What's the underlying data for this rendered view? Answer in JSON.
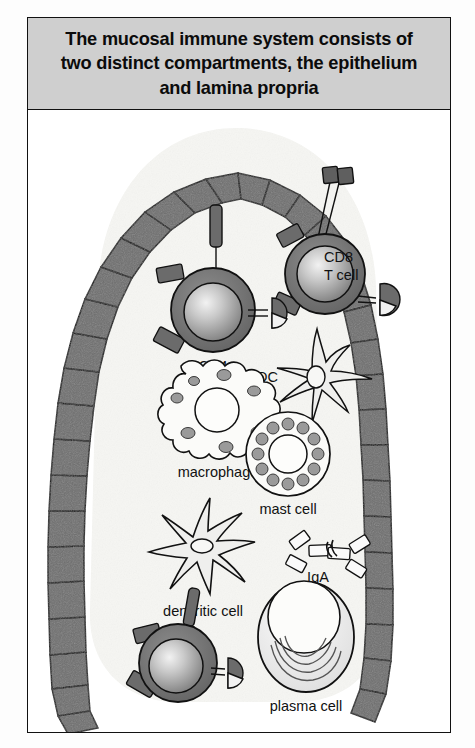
{
  "figure": {
    "title": "The mucosal immune system consists of\ntwo distinct compartments, the epithelium\nand lamina propria",
    "title_bg": "#cfcfcf",
    "border_color": "#111111",
    "background": "#ffffff"
  },
  "diagram": {
    "type": "biological-schematic",
    "compartments": [
      {
        "id": "epithelium",
        "color": "#6e6e6e",
        "description": "arch of columnar epithelial cells"
      },
      {
        "id": "lamina-propria",
        "color": "#f7f7f5",
        "description": "interior space beneath epithelium"
      }
    ],
    "cells": [
      {
        "id": "cd8-t-cell",
        "label": "CD8\nT cell",
        "label_line1": "CD8",
        "label_line2": "T cell",
        "location": "intraepithelial",
        "features": [
          "two stalked receptors",
          "gradient nucleus",
          "pacman receptor",
          "membrane blocks"
        ]
      },
      {
        "id": "cd4-t-cell",
        "label": "CD4\nT cell",
        "label_line1": "CD4",
        "label_line2": "T cell",
        "location": "lamina propria",
        "features": [
          "single stalked receptor",
          "gradient nucleus",
          "pacman receptor",
          "membrane blocks"
        ]
      },
      {
        "id": "t-cell-lower",
        "label": "",
        "location": "lamina propria lower left",
        "features": [
          "stalked receptor",
          "gradient nucleus",
          "pacman receptor",
          "membrane blocks"
        ]
      },
      {
        "id": "dendritic-cell-epithelial",
        "label": "DC",
        "location": "spanning epithelium",
        "features": [
          "star shaped",
          "long dendrites through epithelium"
        ]
      },
      {
        "id": "macrophage",
        "label": "macrophage",
        "location": "lamina propria",
        "features": [
          "ruffled membrane",
          "central nucleus",
          "cytoplasmic granules"
        ]
      },
      {
        "id": "mast-cell",
        "label": "mast cell",
        "location": "lamina propria",
        "features": [
          "ring of granules",
          "central nucleus"
        ]
      },
      {
        "id": "dendritic-cell",
        "label": "dencritic cell",
        "location": "lamina propria",
        "features": [
          "star shaped",
          "six dendrites",
          "small nucleus"
        ]
      },
      {
        "id": "plasma-cell",
        "label": "plasma cell",
        "location": "lamina propria",
        "features": [
          "oval body",
          "eccentric nucleus",
          "concentric rough ER arcs"
        ]
      }
    ],
    "molecules": [
      {
        "id": "iga",
        "label": "IgA",
        "location": "lamina propria",
        "features": [
          "dimeric antibody",
          "J chain",
          "four Fab arms"
        ]
      }
    ]
  },
  "labels": {
    "cd8_line1": "CD8",
    "cd8_line2": "T cell",
    "cd4_line1": "CD4",
    "cd4_line2": "T cell",
    "dc": "DC",
    "macrophage": "macrophage",
    "mast_cell": "mast cell",
    "dendritic_cell": "dencritic cell",
    "iga": "IgA",
    "plasma_cell": "plasma cell"
  }
}
